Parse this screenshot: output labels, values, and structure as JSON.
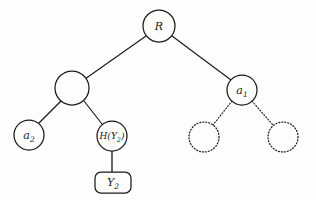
{
  "figure": {
    "kind": "tree-diagram",
    "width": 316,
    "height": 200,
    "background_color": "#fdfdfc",
    "stroke_color": "#1a1a1a"
  },
  "nodes": {
    "root": {
      "id": "root",
      "shape": "circle",
      "label": "R",
      "label_plain": "R",
      "cx": 159,
      "cy": 26,
      "r": 16,
      "border_style": "solid"
    },
    "internal_left": {
      "id": "internal_left",
      "shape": "circle",
      "label": "",
      "label_plain": "",
      "cx": 72,
      "cy": 88,
      "r": 17,
      "border_style": "solid"
    },
    "a1": {
      "id": "a1",
      "shape": "circle",
      "label_base": "a",
      "label_sub": "1",
      "label_plain": "a1",
      "cx": 242,
      "cy": 90,
      "r": 15,
      "border_style": "solid"
    },
    "a2": {
      "id": "a2",
      "shape": "circle",
      "label_base": "a",
      "label_sub": "2",
      "label_plain": "a2",
      "cx": 29,
      "cy": 135,
      "r": 15,
      "border_style": "solid"
    },
    "hash": {
      "id": "hash",
      "shape": "circle",
      "label_base": "H(Y",
      "label_sub": "2",
      "label_tail": ")",
      "label_plain": "H(Y2)",
      "cx": 112,
      "cy": 136,
      "r": 15,
      "border_style": "solid"
    },
    "y2_box": {
      "id": "y2_box",
      "shape": "rounded-rectangle",
      "label_base": "Y",
      "label_sub": "2",
      "label_plain": "Y2",
      "x": 95,
      "y": 172,
      "w": 36,
      "h": 21,
      "rx": 6,
      "border_style": "solid"
    },
    "placeholder_left": {
      "id": "placeholder_left",
      "shape": "circle",
      "label": "",
      "label_plain": "",
      "cx": 204,
      "cy": 137,
      "r": 15,
      "border_style": "dotted"
    },
    "placeholder_right": {
      "id": "placeholder_right",
      "shape": "circle",
      "label": "",
      "label_plain": "",
      "cx": 283,
      "cy": 137,
      "r": 15,
      "border_style": "dotted"
    }
  },
  "edges": [
    {
      "id": "edge-root-internal_left",
      "from": "root",
      "to": "internal_left",
      "x1": 146,
      "y1": 36,
      "x2": 85,
      "y2": 79,
      "style": "solid"
    },
    {
      "id": "edge-root-a1",
      "from": "root",
      "to": "a1",
      "x1": 172,
      "y1": 36,
      "x2": 231,
      "y2": 80,
      "style": "solid"
    },
    {
      "id": "edge-internal_left-a2",
      "from": "internal_left",
      "to": "a2",
      "x1": 61,
      "y1": 101,
      "x2": 39,
      "y2": 123,
      "style": "solid"
    },
    {
      "id": "edge-internal_left-hash",
      "from": "internal_left",
      "to": "hash",
      "x1": 84,
      "y1": 101,
      "x2": 102,
      "y2": 124,
      "style": "solid"
    },
    {
      "id": "edge-hash-y2_box",
      "from": "hash",
      "to": "y2_box",
      "x1": 112,
      "y1": 151,
      "x2": 112,
      "y2": 172,
      "style": "solid"
    },
    {
      "id": "edge-a1-placeholder_left",
      "from": "a1",
      "to": "placeholder_left",
      "x1": 232,
      "y1": 101,
      "x2": 213,
      "y2": 125,
      "style": "dotted"
    },
    {
      "id": "edge-a1-placeholder_right",
      "from": "a1",
      "to": "placeholder_right",
      "x1": 252,
      "y1": 101,
      "x2": 273,
      "y2": 125,
      "style": "dotted"
    }
  ]
}
